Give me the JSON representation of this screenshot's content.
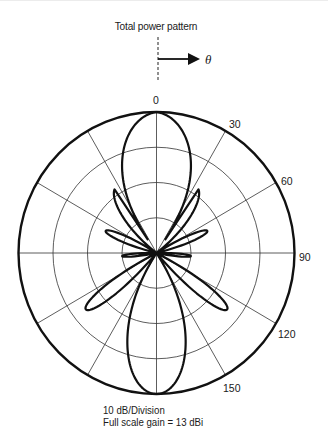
{
  "header": {
    "title": "Total power pattern",
    "direction_symbol": "θ"
  },
  "footer": {
    "line1": "10 dB/Division",
    "line2": "Full scale gain = 13 dBi"
  },
  "chart_data": {
    "type": "polar-line",
    "title": "Total power pattern",
    "angle_unit": "degrees",
    "angle_direction": "clockwise from top",
    "angle_tick_labels": [
      "0",
      "30",
      "60",
      "90",
      "120",
      "150"
    ],
    "angle_spokes_deg": [
      0,
      30,
      60,
      90,
      120,
      150,
      180,
      210,
      240,
      270,
      300,
      330
    ],
    "radial_scale": "10 dB/Division",
    "radial_rings_db": [
      -40,
      -30,
      -20,
      -10,
      0
    ],
    "full_scale_gain_dbi": 13,
    "symmetric_about_0_deg": true,
    "series": [
      {
        "name": "Total power pattern",
        "lobes": [
          {
            "center_deg": 0,
            "peak_db": 0,
            "half_width_deg": 33
          },
          {
            "center_deg": 52,
            "peak_db": -14,
            "half_width_deg": 11
          },
          {
            "center_deg": 85,
            "peak_db": -30,
            "half_width_deg": 6
          },
          {
            "center_deg": 113,
            "peak_db": -24,
            "half_width_deg": 9
          },
          {
            "center_deg": 148,
            "peak_db": -18,
            "half_width_deg": 20
          },
          {
            "center_deg": 180,
            "peak_db": -27,
            "half_width_deg": 12
          }
        ],
        "approx_points_deg_db": [
          [
            0,
            0
          ],
          [
            15,
            -2
          ],
          [
            29,
            -10
          ],
          [
            33,
            -40
          ],
          [
            42,
            -30
          ],
          [
            52,
            -14
          ],
          [
            62,
            -40
          ],
          [
            80,
            -38
          ],
          [
            85,
            -30
          ],
          [
            90,
            -38
          ],
          [
            104,
            -38
          ],
          [
            113,
            -24
          ],
          [
            122,
            -38
          ],
          [
            130,
            -36
          ],
          [
            150,
            -18
          ],
          [
            165,
            -23
          ],
          [
            180,
            -27
          ]
        ]
      }
    ]
  },
  "colors": {
    "pattern": "#111111",
    "grid": "#333333",
    "background": "#ffffff"
  }
}
